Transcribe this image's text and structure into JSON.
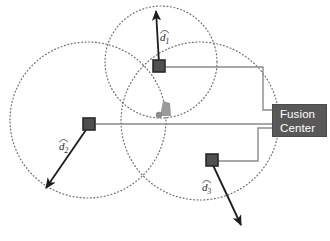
{
  "figure": {
    "type": "diagram",
    "background_color": "#ffffff",
    "width": 330,
    "height": 241
  },
  "colors": {
    "circle_stroke": "#6d6d6d",
    "sensor_fill": "#4f4f4f",
    "sensor_stroke": "#2a2a2a",
    "vector_stroke": "#1d1d1d",
    "link_stroke": "#8a8a8a",
    "fusion_fill": "#585858",
    "fusion_text": "#ffffff",
    "target_fill": "#9a9a9a"
  },
  "fusion_center": {
    "label": "Fusion\nCenter",
    "line1": "Fusion",
    "line2": "Center",
    "x": 272,
    "y": 104,
    "width": 55,
    "height": 33
  },
  "sensors": [
    {
      "id": "sensor-1",
      "label": "d1",
      "vector_label": "d",
      "vector_subscript": "1",
      "x": 159,
      "y": 66,
      "range_circle": {
        "cx": 161,
        "cy": 62,
        "r": 56
      },
      "vector_tip": {
        "x": 156,
        "y": 8
      },
      "label_pos": {
        "x": 161,
        "y": 35
      },
      "link_path": "M 166 67 L 263 67 L 263 110 L 272 110"
    },
    {
      "id": "sensor-2",
      "label": "d2",
      "vector_label": "d",
      "vector_subscript": "2",
      "x": 89,
      "y": 124,
      "range_circle": {
        "cx": 88,
        "cy": 120,
        "r": 78
      },
      "vector_tip": {
        "x": 44,
        "y": 190
      },
      "label_pos": {
        "x": 60,
        "y": 145
      },
      "link_path": "M 96 124 L 272 124"
    },
    {
      "id": "sensor-3",
      "label": "d3",
      "vector_label": "d",
      "vector_subscript": "3",
      "x": 211,
      "y": 160,
      "range_circle": {
        "cx": 200,
        "cy": 121,
        "r": 79
      },
      "vector_tip": {
        "x": 243,
        "y": 228
      },
      "label_pos": {
        "x": 203,
        "y": 185
      },
      "link_path": "M 218 161 L 258 161 L 258 128 L 272 128"
    }
  ],
  "target": {
    "id": "estimated-target",
    "x": 165,
    "y": 110,
    "dot": {
      "x": 159,
      "y": 115,
      "r": 3
    }
  }
}
